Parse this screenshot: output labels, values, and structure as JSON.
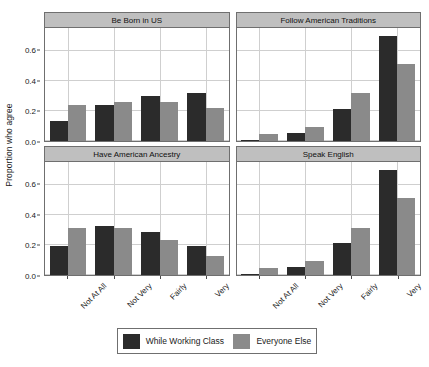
{
  "chart_data": {
    "type": "bar",
    "title": "",
    "subtitle": "",
    "xlabel": "",
    "ylabel": "Proportion who agree",
    "ylim": [
      0,
      0.75
    ],
    "yticks": [
      0.0,
      0.2,
      0.4,
      0.6
    ],
    "ytick_labels": [
      "0.0",
      "0.2",
      "0.4",
      "0.6"
    ],
    "categories": [
      "Not At All",
      "Not Very",
      "Fairly",
      "Very"
    ],
    "grid": true,
    "legend_position": "bottom",
    "legend": [
      {
        "name": "While Working Class",
        "color": "#2b2b2b"
      },
      {
        "name": "Everyone Else",
        "color": "#8a8a8a"
      }
    ],
    "facets": [
      {
        "title": "Be Born in US",
        "series": [
          {
            "name": "While Working Class",
            "values": [
              0.13,
              0.24,
              0.3,
              0.32
            ]
          },
          {
            "name": "Everyone Else",
            "values": [
              0.24,
              0.26,
              0.26,
              0.22
            ]
          }
        ]
      },
      {
        "title": "Follow American Traditions",
        "series": [
          {
            "name": "While Working Class",
            "values": [
              0.01,
              0.055,
              0.215,
              0.7
            ]
          },
          {
            "name": "Everyone Else",
            "values": [
              0.045,
              0.095,
              0.32,
              0.51
            ]
          }
        ]
      },
      {
        "title": "Have American Ancestry",
        "series": [
          {
            "name": "While Working Class",
            "values": [
              0.19,
              0.325,
              0.285,
              0.19
            ]
          },
          {
            "name": "Everyone Else",
            "values": [
              0.31,
              0.31,
              0.23,
              0.125
            ]
          }
        ]
      },
      {
        "title": "Speak English",
        "series": [
          {
            "name": "While Working Class",
            "values": [
              0.01,
              0.055,
              0.215,
              0.695
            ]
          },
          {
            "name": "Everyone Else",
            "values": [
              0.045,
              0.095,
              0.315,
              0.51
            ]
          }
        ]
      }
    ]
  },
  "axis": {
    "y_title": "Proportion who agree"
  }
}
